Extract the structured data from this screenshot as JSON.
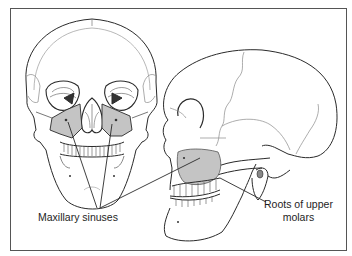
{
  "figure": {
    "caption_fragment": "",
    "labels": {
      "maxillary_sinuses": "Maxillary sinuses",
      "roots_line1": "Roots of upper",
      "roots_line2": "molars"
    },
    "views": [
      "frontal-skull",
      "lateral-skull"
    ],
    "colors": {
      "outline": "#2a2a2a",
      "suture": "#8a8a8a",
      "sinus_fill": "#c4c4c4",
      "frame": "#555555",
      "background": "#ffffff"
    }
  }
}
